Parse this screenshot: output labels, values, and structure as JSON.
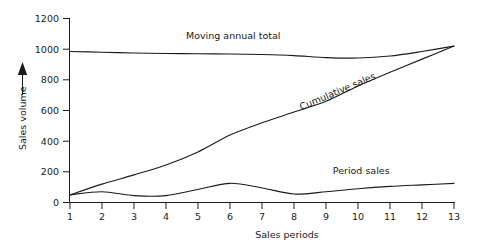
{
  "chart_data": {
    "type": "line",
    "title": "",
    "xlabel": "Sales periods",
    "ylabel": "Sales volume",
    "x": [
      1,
      2,
      3,
      4,
      5,
      6,
      7,
      8,
      9,
      10,
      11,
      12,
      13
    ],
    "xtick_labels": [
      "1",
      "2",
      "3",
      "4",
      "5",
      "6",
      "7",
      "8",
      "9",
      "10",
      "11",
      "12",
      "13"
    ],
    "ytick_labels": [
      "0",
      "200",
      "400",
      "600",
      "800",
      "1000",
      "1200"
    ],
    "ytick_values": [
      0,
      200,
      400,
      600,
      800,
      1000,
      1200
    ],
    "xlim": [
      1,
      13
    ],
    "ylim": [
      0,
      1200
    ],
    "grid": false,
    "legend_position": "inline-annotations",
    "series": [
      {
        "name": "Moving annual total",
        "label_x": 6.1,
        "label_y": 1065,
        "values": [
          985,
          980,
          975,
          972,
          970,
          968,
          965,
          958,
          945,
          942,
          955,
          985,
          1020
        ]
      },
      {
        "name": "Cumulative sales",
        "label_x": 9.4,
        "label_y": 705,
        "values": [
          50,
          120,
          180,
          245,
          330,
          440,
          520,
          590,
          660,
          760,
          850,
          935,
          1020
        ]
      },
      {
        "name": "Period sales",
        "label_x": 10.1,
        "label_y": 185,
        "values": [
          50,
          70,
          45,
          45,
          85,
          125,
          95,
          55,
          70,
          90,
          105,
          115,
          125
        ]
      }
    ],
    "axis_arrow": "up-arrow-on-y-axis-label"
  },
  "axes": {
    "y_axis_label": "Sales volume",
    "x_axis_label": "Sales periods"
  }
}
